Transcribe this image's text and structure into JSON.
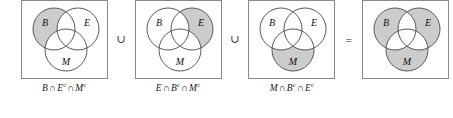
{
  "figure": {
    "type": "venn-identity",
    "shade_color": "#cccccc",
    "outline_color": "#5a5a5a",
    "border_color": "#8a8a8a",
    "set_labels": {
      "b": "B",
      "e": "E",
      "m": "M"
    },
    "operators": {
      "union": "∪",
      "intersect": "∩",
      "equals": "=",
      "complement": "c"
    },
    "connectors": [
      {
        "symbol": "∪",
        "name": "union"
      },
      {
        "symbol": "∪",
        "name": "union"
      },
      {
        "symbol": "=",
        "name": "equals"
      }
    ],
    "panels": [
      {
        "id": "panel-1",
        "shaded_regions": [
          "b-only"
        ],
        "caption": {
          "text": "B ∩ Eᶜ ∩ Mᶜ",
          "parts": [
            {
              "set": "B",
              "comp": ""
            },
            {
              "op": "∩"
            },
            {
              "set": "E",
              "comp": "c"
            },
            {
              "op": "∩"
            },
            {
              "set": "M",
              "comp": "c"
            }
          ]
        }
      },
      {
        "id": "panel-2",
        "shaded_regions": [
          "e-only"
        ],
        "caption": {
          "text": "E ∩ Bᶜ ∩ Mᶜ",
          "parts": [
            {
              "set": "E",
              "comp": ""
            },
            {
              "op": "∩"
            },
            {
              "set": "B",
              "comp": "c"
            },
            {
              "op": "∩"
            },
            {
              "set": "M",
              "comp": "c"
            }
          ]
        }
      },
      {
        "id": "panel-3",
        "shaded_regions": [
          "m-only"
        ],
        "caption": {
          "text": "M ∩ Bᶜ ∩ Eᶜ",
          "parts": [
            {
              "set": "M",
              "comp": ""
            },
            {
              "op": "∩"
            },
            {
              "set": "B",
              "comp": "c"
            },
            {
              "op": "∩"
            },
            {
              "set": "E",
              "comp": "c"
            }
          ]
        }
      },
      {
        "id": "panel-4",
        "shaded_regions": [
          "b-only",
          "e-only",
          "m-only"
        ],
        "caption": {
          "text": "",
          "parts": []
        }
      }
    ]
  }
}
